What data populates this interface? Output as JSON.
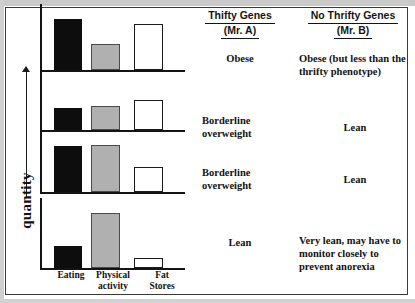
{
  "figure": {
    "yaxis_label": "quantity",
    "columns": [
      {
        "title": "Thifty Genes",
        "subtitle": "(Mr. A)"
      },
      {
        "title": "No Thrifty Genes",
        "subtitle": "(Mr. B)"
      }
    ],
    "x_categories": [
      {
        "line1": "Eating",
        "line2": ""
      },
      {
        "line1": "Physical",
        "line2": "activity"
      },
      {
        "line1": "Fat",
        "line2": "Stores"
      }
    ],
    "rows": [
      {
        "outcome_a": "Obese",
        "outcome_b": "Obese (but less than the thrifty phenotype)"
      },
      {
        "outcome_a": "Borderline overweight",
        "outcome_b": "Lean"
      },
      {
        "outcome_a": "Borderline overweight",
        "outcome_b": "Lean"
      },
      {
        "outcome_a": "Lean",
        "outcome_b": "Very lean, may have to monitor closely to prevent anorexia"
      }
    ],
    "colors": {
      "eating_bar": "#0d0d0d",
      "activity_bar": "#b0b0b0",
      "fat_bar": "#ffffff",
      "axis": "#141414",
      "text": "#121212",
      "frame": "#3a3a3a"
    }
  },
  "chart_data": {
    "type": "bar",
    "title": "",
    "xlabel": "",
    "ylabel": "quantity",
    "ylim": [
      0,
      100
    ],
    "grid": false,
    "legend": "none",
    "categories": [
      "Eating",
      "Physical activity",
      "Fat Stores"
    ],
    "panels": [
      {
        "name": "Row 1 - high eating, low activity, high fat stores",
        "values": [
          88,
          45,
          80
        ],
        "outcome_thrifty": "Obese",
        "outcome_no_thrifty": "Obese (but less than the thrifty phenotype)"
      },
      {
        "name": "Row 2 - moderate eating, moderate activity, high fat stores",
        "values": [
          42,
          46,
          58
        ],
        "outcome_thrifty": "Borderline overweight",
        "outcome_no_thrifty": "Lean"
      },
      {
        "name": "Row 3 - high eating, high activity, moderate fat stores",
        "values": [
          82,
          84,
          45
        ],
        "outcome_thrifty": "Borderline overweight",
        "outcome_no_thrifty": "Lean"
      },
      {
        "name": "Row 4 - low eating, high activity, very low fat stores",
        "values": [
          35,
          88,
          16
        ],
        "outcome_thrifty": "Lean",
        "outcome_no_thrifty": "Very lean, may have to monitor closely to prevent anorexia"
      }
    ]
  }
}
